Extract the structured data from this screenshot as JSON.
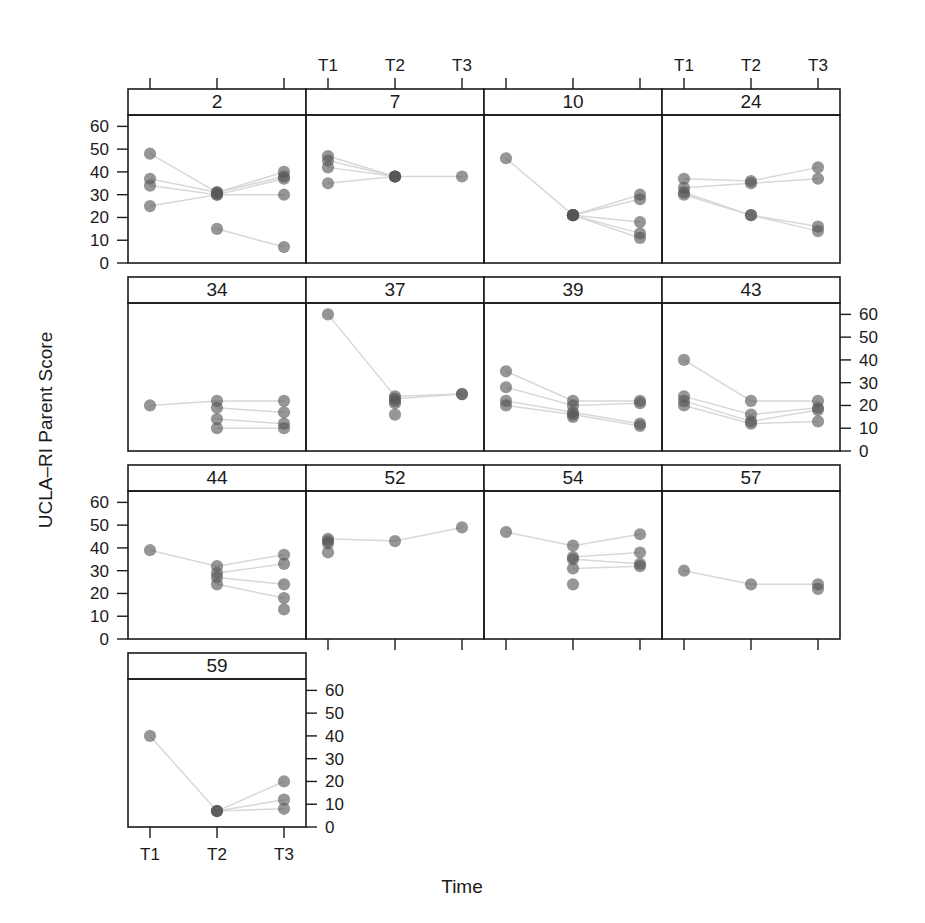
{
  "figure": {
    "ylabel": "UCLA–RI Parent Score",
    "xlabel": "Time",
    "x_tick_labels": [
      "T1",
      "T2",
      "T3"
    ],
    "y_tick_labels": [
      "0",
      "10",
      "20",
      "30",
      "40",
      "50",
      "60"
    ],
    "y_tick_values": [
      0,
      10,
      20,
      30,
      40,
      50,
      60
    ],
    "point_color": "#555555",
    "line_color": "#d8d8d8",
    "frame_color": "#1a1a1a",
    "strip_fill": "#ffffff"
  },
  "chart_data": {
    "type": "scatter",
    "title": "",
    "xlabel": "Time",
    "ylabel": "UCLA–RI Parent Score",
    "x": [
      "T1",
      "T2",
      "T3"
    ],
    "ylim": [
      0,
      65
    ],
    "grid": false,
    "legend": "none",
    "layout": {
      "rows": 4,
      "cols": 4,
      "panel_order": "rowwise"
    },
    "axis_side": {
      "row1": "left",
      "row2": "right",
      "row3": "left",
      "row4": "right"
    },
    "panels": [
      {
        "label": "2",
        "row": 1,
        "col": 1,
        "series": [
          {
            "values": [
              48,
              31,
              40
            ]
          },
          {
            "values": [
              37,
              31,
              38
            ]
          },
          {
            "values": [
              34,
              30,
              37
            ]
          },
          {
            "values": [
              25,
              30,
              30
            ]
          },
          {
            "values": [
              null,
              15,
              7
            ]
          }
        ]
      },
      {
        "label": "7",
        "row": 1,
        "col": 2,
        "series": [
          {
            "values": [
              47,
              38,
              38
            ]
          },
          {
            "values": [
              45,
              38,
              null
            ]
          },
          {
            "values": [
              42,
              38,
              null
            ]
          },
          {
            "values": [
              35,
              38,
              null
            ]
          }
        ]
      },
      {
        "label": "10",
        "row": 1,
        "col": 3,
        "series": [
          {
            "values": [
              46,
              21,
              30
            ]
          },
          {
            "values": [
              null,
              21,
              28
            ]
          },
          {
            "values": [
              null,
              21,
              18
            ]
          },
          {
            "values": [
              null,
              21,
              13
            ]
          },
          {
            "values": [
              null,
              21,
              11
            ]
          }
        ]
      },
      {
        "label": "24",
        "row": 1,
        "col": 4,
        "series": [
          {
            "values": [
              37,
              36,
              42
            ]
          },
          {
            "values": [
              33,
              35,
              37
            ]
          },
          {
            "values": [
              31,
              21,
              16
            ]
          },
          {
            "values": [
              30,
              21,
              14
            ]
          }
        ]
      },
      {
        "label": "34",
        "row": 2,
        "col": 1,
        "series": [
          {
            "values": [
              20,
              22,
              22
            ]
          },
          {
            "values": [
              null,
              19,
              17
            ]
          },
          {
            "values": [
              null,
              14,
              12
            ]
          },
          {
            "values": [
              null,
              10,
              10
            ]
          }
        ]
      },
      {
        "label": "37",
        "row": 2,
        "col": 2,
        "series": [
          {
            "values": [
              60,
              24,
              25
            ]
          },
          {
            "values": [
              null,
              23,
              25
            ]
          },
          {
            "values": [
              null,
              22,
              null
            ]
          },
          {
            "values": [
              null,
              21,
              null
            ]
          },
          {
            "values": [
              null,
              16,
              null
            ]
          }
        ]
      },
      {
        "label": "39",
        "row": 2,
        "col": 3,
        "series": [
          {
            "values": [
              35,
              22,
              22
            ]
          },
          {
            "values": [
              28,
              20,
              21
            ]
          },
          {
            "values": [
              22,
              17,
              12
            ]
          },
          {
            "values": [
              20,
              16,
              11
            ]
          },
          {
            "values": [
              null,
              15,
              null
            ]
          }
        ]
      },
      {
        "label": "43",
        "row": 2,
        "col": 4,
        "series": [
          {
            "values": [
              40,
              22,
              22
            ]
          },
          {
            "values": [
              24,
              16,
              19
            ]
          },
          {
            "values": [
              22,
              13,
              18
            ]
          },
          {
            "values": [
              20,
              12,
              13
            ]
          }
        ]
      },
      {
        "label": "44",
        "row": 3,
        "col": 1,
        "series": [
          {
            "values": [
              39,
              32,
              37
            ]
          },
          {
            "values": [
              null,
              29,
              33
            ]
          },
          {
            "values": [
              null,
              27,
              24
            ]
          },
          {
            "values": [
              null,
              24,
              18
            ]
          },
          {
            "values": [
              null,
              null,
              13
            ]
          }
        ]
      },
      {
        "label": "52",
        "row": 3,
        "col": 2,
        "series": [
          {
            "values": [
              44,
              43,
              49
            ]
          },
          {
            "values": [
              43,
              null,
              null
            ]
          },
          {
            "values": [
              42,
              null,
              null
            ]
          },
          {
            "values": [
              38,
              null,
              null
            ]
          }
        ]
      },
      {
        "label": "54",
        "row": 3,
        "col": 3,
        "series": [
          {
            "values": [
              47,
              41,
              46
            ]
          },
          {
            "values": [
              null,
              36,
              38
            ]
          },
          {
            "values": [
              null,
              35,
              33
            ]
          },
          {
            "values": [
              null,
              31,
              32
            ]
          },
          {
            "values": [
              null,
              24,
              null
            ]
          }
        ]
      },
      {
        "label": "57",
        "row": 3,
        "col": 4,
        "series": [
          {
            "values": [
              30,
              24,
              24
            ]
          },
          {
            "values": [
              null,
              null,
              22
            ]
          }
        ]
      },
      {
        "label": "59",
        "row": 4,
        "col": 1,
        "series": [
          {
            "values": [
              40,
              7,
              20
            ]
          },
          {
            "values": [
              null,
              7,
              12
            ]
          },
          {
            "values": [
              null,
              7,
              8
            ]
          }
        ]
      }
    ]
  }
}
